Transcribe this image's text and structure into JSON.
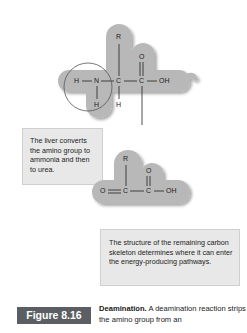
{
  "figure": {
    "label": "Figure 8.16",
    "caption_title": "Deamination.",
    "caption_text": "A deamination reaction strips the amino group from an"
  },
  "amino_acid": {
    "atoms": {
      "h_left": "H",
      "n": "N",
      "c_alpha": "C",
      "c_carboxyl": "C",
      "oh": "OH",
      "r": "R",
      "o_top": "O",
      "h_below_n": "H",
      "h_below_c": "H"
    }
  },
  "keto_acid": {
    "atoms": {
      "o_left": "O",
      "c_alpha": "C",
      "c_carboxyl": "C",
      "oh": "OH",
      "r": "R",
      "o_top": "O"
    }
  },
  "callouts": {
    "liver": "The liver converts the amino group to ammonia and then to urea.",
    "skeleton": "The structure of the remaining carbon skeleton determines where it can enter the energy-producing pathways."
  },
  "colors": {
    "blob": "#b8b8b8",
    "callout_bg": "#e8e8e8",
    "badge_bg": "#5b5f63"
  }
}
